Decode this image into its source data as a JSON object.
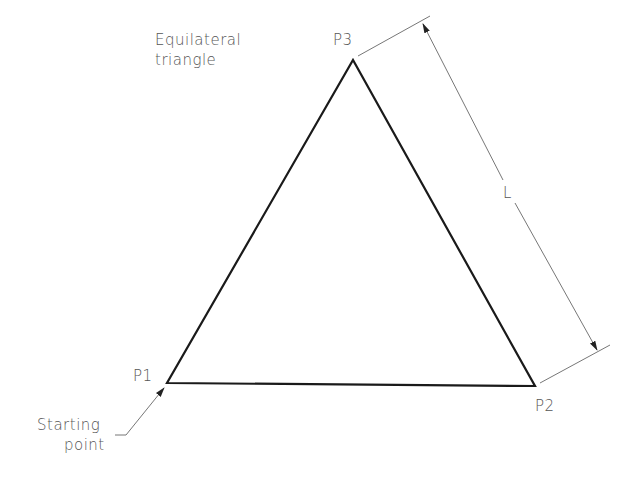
{
  "diagram": {
    "title_lines": [
      "Equilateral",
      "triangle"
    ],
    "vertices": {
      "p1": {
        "label": "P1",
        "x": 167,
        "y": 383
      },
      "p2": {
        "label": "P2",
        "x": 535,
        "y": 386
      },
      "p3": {
        "label": "P3",
        "x": 353,
        "y": 60
      }
    },
    "dimension_label": "L",
    "start_note_lines": [
      "Starting",
      "point"
    ],
    "colors": {
      "triangle_stroke": "#1a1a1a",
      "dimension_stroke": "#666666",
      "text": "#555555"
    }
  }
}
